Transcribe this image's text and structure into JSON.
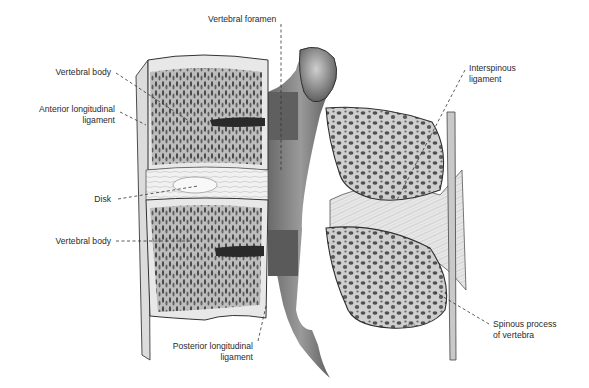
{
  "figure": {
    "colors": {
      "background": "#ffffff",
      "label_text": "#2a2a2a",
      "leader_line": "#333333",
      "bone_light": "#e6e6e6",
      "bone_mid": "#a9a9a9",
      "bone_dark": "#555555",
      "cancellous_pore": "#3a3a3a"
    }
  },
  "labels": [
    {
      "id": "vertebral-foramen",
      "lines": [
        "Vertebral foramen"
      ]
    },
    {
      "id": "vertebral-body-upper",
      "lines": [
        "Vertebral body"
      ]
    },
    {
      "id": "anterior-longitudinal-ligament",
      "lines": [
        "Anterior longitudinal",
        "ligament"
      ]
    },
    {
      "id": "disk",
      "lines": [
        "Disk"
      ]
    },
    {
      "id": "vertebral-body-lower",
      "lines": [
        "Vertebral body"
      ]
    },
    {
      "id": "posterior-longitudinal-ligament",
      "lines": [
        "Posterior longitudinal",
        "ligament"
      ]
    },
    {
      "id": "interspinous-ligament",
      "lines": [
        "Interspinous",
        "ligament"
      ]
    },
    {
      "id": "spinous-process",
      "lines": [
        "Spinous process",
        "of vertebra"
      ]
    }
  ],
  "signature": "M.G."
}
